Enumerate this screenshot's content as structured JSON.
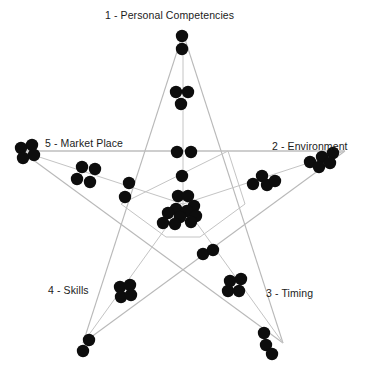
{
  "chart_data": {
    "type": "scatter",
    "title": "",
    "xlabel": "",
    "ylabel": "",
    "grid": false,
    "legend_position": "none",
    "axes_labels": [
      {
        "id": "axis-1",
        "label": "1 - Personal Competencies",
        "angle_deg": 90
      },
      {
        "id": "axis-2",
        "label": "2 - Environment",
        "angle_deg": 18
      },
      {
        "id": "axis-3",
        "label": "3 - Timing",
        "angle_deg": -54
      },
      {
        "id": "axis-4",
        "label": "4 - Skills",
        "angle_deg": -126
      },
      {
        "id": "axis-5",
        "label": "5 - Market Place",
        "angle_deg": 162
      }
    ],
    "center": {
      "x": 183,
      "y": 204
    },
    "star_outer_points": [
      {
        "x": 183,
        "y": 33
      },
      {
        "x": 345,
        "y": 151
      },
      {
        "x": 283,
        "y": 343
      },
      {
        "x": 83,
        "y": 343
      },
      {
        "x": 21,
        "y": 151
      }
    ],
    "star_inner_points": [
      {
        "x": 228,
        "y": 151
      },
      {
        "x": 245,
        "y": 204
      },
      {
        "x": 200,
        "y": 237
      },
      {
        "x": 166,
        "y": 237
      },
      {
        "x": 121,
        "y": 204
      }
    ],
    "points": [
      {
        "x": 182,
        "y": 36,
        "r": 6.2
      },
      {
        "x": 182,
        "y": 49,
        "r": 6.2
      },
      {
        "x": 176,
        "y": 92,
        "r": 6.2
      },
      {
        "x": 188,
        "y": 92,
        "r": 6.2
      },
      {
        "x": 181,
        "y": 104,
        "r": 6.2
      },
      {
        "x": 177,
        "y": 152,
        "r": 6.2
      },
      {
        "x": 191,
        "y": 152,
        "r": 6.2
      },
      {
        "x": 182,
        "y": 176,
        "r": 6.2
      },
      {
        "x": 21,
        "y": 148,
        "r": 6.2
      },
      {
        "x": 32,
        "y": 145,
        "r": 6.2
      },
      {
        "x": 23,
        "y": 158,
        "r": 6.2
      },
      {
        "x": 34,
        "y": 155,
        "r": 6.2
      },
      {
        "x": 82,
        "y": 167,
        "r": 6.2
      },
      {
        "x": 95,
        "y": 169,
        "r": 6.2
      },
      {
        "x": 77,
        "y": 179,
        "r": 6.2
      },
      {
        "x": 90,
        "y": 182,
        "r": 6.2
      },
      {
        "x": 129,
        "y": 183,
        "r": 6.2
      },
      {
        "x": 125,
        "y": 197,
        "r": 6.2
      },
      {
        "x": 310,
        "y": 162,
        "r": 6.2
      },
      {
        "x": 322,
        "y": 157,
        "r": 6.2
      },
      {
        "x": 333,
        "y": 153,
        "r": 6.2
      },
      {
        "x": 319,
        "y": 167,
        "r": 6.2
      },
      {
        "x": 330,
        "y": 163,
        "r": 6.2
      },
      {
        "x": 262,
        "y": 176,
        "r": 6.2
      },
      {
        "x": 253,
        "y": 184,
        "r": 6.2
      },
      {
        "x": 267,
        "y": 185,
        "r": 6.2
      },
      {
        "x": 275,
        "y": 181,
        "r": 6.2
      },
      {
        "x": 178,
        "y": 196,
        "r": 6.2
      },
      {
        "x": 188,
        "y": 196,
        "r": 6.2
      },
      {
        "x": 194,
        "y": 206,
        "r": 6.2
      },
      {
        "x": 176,
        "y": 209,
        "r": 6.2
      },
      {
        "x": 187,
        "y": 211,
        "r": 6.2
      },
      {
        "x": 196,
        "y": 216,
        "r": 6.2
      },
      {
        "x": 168,
        "y": 213,
        "r": 6.2
      },
      {
        "x": 180,
        "y": 217,
        "r": 6.2
      },
      {
        "x": 191,
        "y": 222,
        "r": 6.2
      },
      {
        "x": 163,
        "y": 223,
        "r": 6.2
      },
      {
        "x": 175,
        "y": 224,
        "r": 6.2
      },
      {
        "x": 203,
        "y": 254,
        "r": 6.2
      },
      {
        "x": 213,
        "y": 250,
        "r": 6.2
      },
      {
        "x": 230,
        "y": 281,
        "r": 6.2
      },
      {
        "x": 241,
        "y": 279,
        "r": 6.2
      },
      {
        "x": 228,
        "y": 291,
        "r": 6.2
      },
      {
        "x": 239,
        "y": 291,
        "r": 6.2
      },
      {
        "x": 120,
        "y": 287,
        "r": 6.2
      },
      {
        "x": 130,
        "y": 285,
        "r": 6.2
      },
      {
        "x": 121,
        "y": 297,
        "r": 6.2
      },
      {
        "x": 131,
        "y": 295,
        "r": 6.2
      },
      {
        "x": 89,
        "y": 340,
        "r": 6.2
      },
      {
        "x": 83,
        "y": 351,
        "r": 6.2
      },
      {
        "x": 264,
        "y": 333,
        "r": 6.2
      },
      {
        "x": 266,
        "y": 345,
        "r": 6.2
      },
      {
        "x": 272,
        "y": 354,
        "r": 6.2
      }
    ],
    "colors": {
      "point": "#0d0d0d",
      "line": "#b9b9b9",
      "label": "#1b1b1b",
      "background": "#ffffff"
    }
  }
}
